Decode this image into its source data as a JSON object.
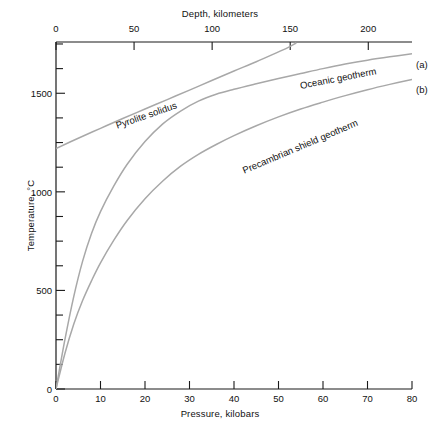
{
  "chart_data": {
    "type": "line",
    "title": "",
    "xlabel": "Pressure, kilobars",
    "ylabel": "Temperature, °C",
    "x2label": "Depth, kilometers",
    "xlim": [
      0,
      80
    ],
    "ylim": [
      0,
      1760
    ],
    "x2lim": [
      0,
      228
    ],
    "grid": false,
    "legend": "inline-labels",
    "xticks": [
      0,
      10,
      20,
      30,
      40,
      50,
      60,
      70,
      80
    ],
    "xticklabels": [
      "0",
      "10",
      "20",
      "30",
      "40",
      "50",
      "60",
      "70",
      "80"
    ],
    "x2ticks": [
      0,
      50,
      100,
      150,
      200
    ],
    "x2ticklabels": [
      "0",
      "50",
      "100",
      "150",
      "200"
    ],
    "yticks": [
      0,
      500,
      1000,
      1500
    ],
    "yticklabels": [
      "0",
      "500",
      "1000",
      "1500"
    ],
    "yminorticks": [
      125,
      250,
      375,
      625,
      750,
      875,
      1125,
      1250,
      1375,
      1625,
      1750
    ],
    "series": [
      {
        "name": "Pyrolite solidus",
        "key": "",
        "color": "#a8a8a8",
        "label_angle": -19,
        "points": [
          [
            0,
            1220
          ],
          [
            5,
            1272
          ],
          [
            10,
            1322
          ],
          [
            15,
            1372
          ],
          [
            20,
            1420
          ],
          [
            25,
            1468
          ],
          [
            30,
            1516
          ],
          [
            35,
            1565
          ],
          [
            40,
            1613
          ],
          [
            45,
            1660
          ],
          [
            50,
            1710
          ],
          [
            52,
            1730
          ],
          [
            54,
            1755
          ]
        ]
      },
      {
        "name": "Oceanic geotherm",
        "key": "(a)",
        "color": "#a8a8a8",
        "label_angle": -11,
        "points": [
          [
            0,
            0
          ],
          [
            2,
            250
          ],
          [
            4,
            470
          ],
          [
            6,
            650
          ],
          [
            8,
            790
          ],
          [
            10,
            900
          ],
          [
            13,
            1030
          ],
          [
            16,
            1140
          ],
          [
            20,
            1255
          ],
          [
            24,
            1345
          ],
          [
            28,
            1410
          ],
          [
            32,
            1460
          ],
          [
            36,
            1495
          ],
          [
            40,
            1520
          ],
          [
            45,
            1548
          ],
          [
            50,
            1575
          ],
          [
            55,
            1600
          ],
          [
            60,
            1625
          ],
          [
            65,
            1648
          ],
          [
            70,
            1668
          ],
          [
            75,
            1685
          ],
          [
            80,
            1700
          ]
        ]
      },
      {
        "name": "Precambrian shield geotherm",
        "key": "(b)",
        "color": "#a8a8a8",
        "label_angle": -23,
        "points": [
          [
            0,
            0
          ],
          [
            2,
            180
          ],
          [
            4,
            330
          ],
          [
            6,
            450
          ],
          [
            8,
            550
          ],
          [
            10,
            640
          ],
          [
            13,
            755
          ],
          [
            16,
            855
          ],
          [
            20,
            965
          ],
          [
            24,
            1055
          ],
          [
            28,
            1130
          ],
          [
            32,
            1190
          ],
          [
            36,
            1240
          ],
          [
            40,
            1285
          ],
          [
            45,
            1335
          ],
          [
            50,
            1380
          ],
          [
            55,
            1420
          ],
          [
            60,
            1455
          ],
          [
            65,
            1488
          ],
          [
            70,
            1518
          ],
          [
            75,
            1545
          ],
          [
            80,
            1570
          ]
        ]
      }
    ]
  }
}
